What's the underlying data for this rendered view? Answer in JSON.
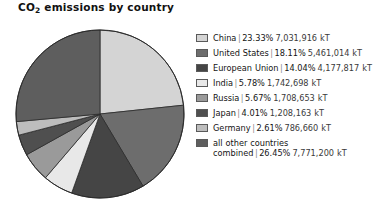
{
  "title": "CO2 emissions by country",
  "title_main": "CO",
  "title_sub": "2",
  "title_rest": " emissions by country",
  "chart_data": {
    "type": "pie",
    "title": "CO2 emissions by country",
    "unit": "kT",
    "start_angle_oclock": 12,
    "direction": "clockwise",
    "legend_position": "right",
    "grid": false,
    "categories": [
      "China",
      "United States",
      "European Union",
      "India",
      "Russia",
      "Japan",
      "Germany",
      "all other countries combined"
    ],
    "percentages": [
      23.33,
      18.11,
      14.04,
      5.78,
      5.67,
      4.01,
      2.61,
      26.45
    ],
    "values": [
      7031916,
      5461014,
      4177817,
      1742698,
      1708653,
      1208163,
      786660,
      7771200
    ],
    "colors": [
      "#d4d4d4",
      "#6d6d6d",
      "#454545",
      "#e8e8e8",
      "#9a9a9a",
      "#4f4f4f",
      "#bdbdbd",
      "#5e5e5e"
    ],
    "slices": [
      {
        "label": "China",
        "percent": "23.33%",
        "value": "7,031,916 kT",
        "color": "#d4d4d4"
      },
      {
        "label": "United States",
        "percent": "18.11%",
        "value": "5,461,014 kT",
        "color": "#6d6d6d"
      },
      {
        "label": "European Union",
        "percent": "14.04%",
        "value": "4,177,817 kT",
        "color": "#454545"
      },
      {
        "label": "India",
        "percent": "5.78%",
        "value": "1,742,698 kT",
        "color": "#e8e8e8"
      },
      {
        "label": "Russia",
        "percent": "5.67%",
        "value": "1,708,653 kT",
        "color": "#9a9a9a"
      },
      {
        "label": "Japan",
        "percent": "4.01%",
        "value": "1,208,163 kT",
        "color": "#4f4f4f"
      },
      {
        "label": "Germany",
        "percent": "2.61%",
        "value": "786,660 kT",
        "color": "#bdbdbd"
      },
      {
        "label": "all other countries combined",
        "percent": "26.45%",
        "value": "7,771,200 kT",
        "color": "#5e5e5e"
      }
    ]
  },
  "legend": {
    "separator": "|",
    "rows": [
      {
        "label": "China",
        "percent": "23.33%",
        "value": "7,031,916 kT",
        "color": "#d4d4d4"
      },
      {
        "label": "United States",
        "percent": "18.11%",
        "value": "5,461,014 kT",
        "color": "#6d6d6d"
      },
      {
        "label": "European Union",
        "percent": "14.04%",
        "value": "4,177,817 kT",
        "color": "#454545"
      },
      {
        "label": "India",
        "percent": "5.78%",
        "value": "1,742,698 kT",
        "color": "#e8e8e8"
      },
      {
        "label": "Russia",
        "percent": "5.67%",
        "value": "1,708,653 kT",
        "color": "#9a9a9a"
      },
      {
        "label": "Japan",
        "percent": "4.01%",
        "value": "1,208,163 kT",
        "color": "#4f4f4f"
      },
      {
        "label": "Germany",
        "percent": "2.61%",
        "value": "786,660 kT",
        "color": "#bdbdbd"
      },
      {
        "label": "all other countries combined",
        "percent": "26.45%",
        "value": "7,771,200 kT",
        "color": "#5e5e5e"
      }
    ]
  }
}
